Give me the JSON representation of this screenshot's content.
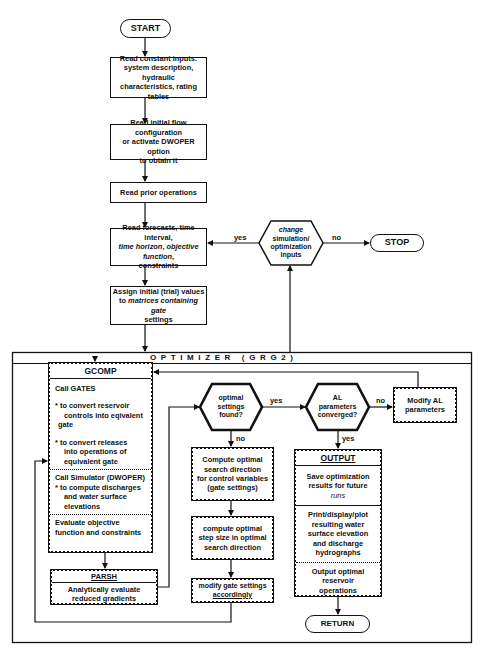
{
  "diagram": {
    "start": "START",
    "stop": "STOP",
    "return": "RETURN",
    "steps": {
      "read_constants": [
        "Read constant inputs:",
        "system description, hydraulic",
        "characteristics, rating tables"
      ],
      "read_initial_flow": [
        "Read initial flow configuration",
        "or activate DWOPER option",
        "to obtain it"
      ],
      "read_prior": "Read prior operations",
      "read_forecasts": {
        "line1": "Read forecasts, time interval,",
        "line2_italic_a": "time horizon",
        "line2_sep": ", ",
        "line2_italic_b": "objective function",
        "line2_end": ",",
        "line3": "constraints"
      },
      "assign_initial": {
        "line1": "Assign initial (trial) values",
        "line2_a": "to ",
        "line2_italic": "matrices containing gate",
        "line3": "settings"
      }
    },
    "decision_change": [
      "change",
      "simulation/",
      "optimization",
      "inputs"
    ],
    "decision_change_yes": "yes",
    "decision_change_no": "no",
    "optimizer": {
      "title": "O P T I M I Z E R   ( G R G 2 )",
      "gcomp": {
        "title": "GCOMP",
        "call_gates": "Call GATES",
        "bullet1": [
          "* to convert reservoir",
          "controls into eqivalent",
          "gate"
        ],
        "bullet2": [
          "* to convert releases",
          "into operations of",
          "equivalent gate"
        ],
        "simulator": "Call Simulator (DWOPER)",
        "bullet3": [
          "* to compute discharges",
          "and water surface",
          "elevations"
        ],
        "evaluate": [
          "Evaluate objective",
          "function and constraints"
        ]
      },
      "parsh": {
        "title": "PARSH",
        "body": [
          "Analytically evaluate",
          "reduced gradients"
        ]
      },
      "decision_optimal": [
        "optimal",
        "settings",
        "found?"
      ],
      "decision_optimal_yes": "yes",
      "decision_optimal_no": "no",
      "search_direction": [
        "Compute optimal",
        "search direction",
        "for control variables",
        "(gate settings)"
      ],
      "step_size": [
        "compute optimal",
        "step size in optimal",
        "search direction"
      ],
      "modify_gate": [
        "modify gate settings",
        "accordingly"
      ],
      "decision_al": [
        "AL",
        "parameters",
        "converged?"
      ],
      "decision_al_yes": "yes",
      "decision_al_no": "no",
      "modify_al": [
        "Modify AL",
        "parameters"
      ],
      "output": {
        "title": "OUTPUT",
        "save": [
          "Save optimization",
          "results for future",
          "runs"
        ],
        "print": [
          "Print/display/plot",
          "resulting water",
          "surface elevation",
          "and discharge",
          "hydrographs"
        ],
        "final": [
          "Output optimal",
          "reservoir",
          "operations"
        ]
      }
    }
  }
}
